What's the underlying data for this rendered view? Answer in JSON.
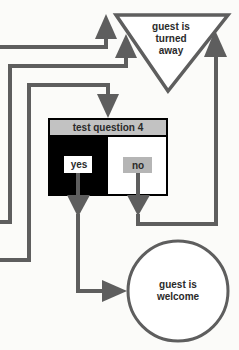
{
  "diagram": {
    "colors": {
      "connector": "#5e5e5e",
      "box_header": "#c2c2c2",
      "box_left": "#000000",
      "box_right": "#ffffff",
      "no_label_bg": "#b5b5b5",
      "yes_label_bg": "#ffffff",
      "outline": "#5e5e5e"
    },
    "nodes": {
      "turned_away": {
        "shape": "inverted-triangle",
        "lines": [
          "guest is",
          "turned",
          "away"
        ]
      },
      "question": {
        "shape": "decision-box",
        "title": "test question 4",
        "yes_label": "yes",
        "no_label": "no"
      },
      "welcome": {
        "shape": "circle",
        "lines": [
          "guest is",
          "welcome"
        ]
      }
    },
    "edges": [
      {
        "from": "offscreen-left-1",
        "to": "turned_away"
      },
      {
        "from": "offscreen-left-2",
        "to": "turned_away"
      },
      {
        "from": "offscreen-left-3",
        "to": "question"
      },
      {
        "from": "question.yes",
        "to": "welcome"
      },
      {
        "from": "question.no",
        "to": "turned_away"
      }
    ]
  }
}
